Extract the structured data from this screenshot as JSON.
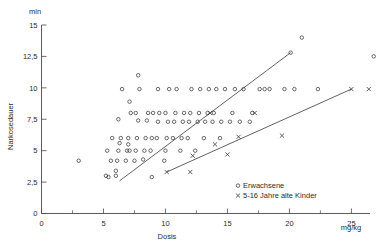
{
  "chart_data": {
    "type": "scatter",
    "title": "",
    "xlabel": "Dosis",
    "ylabel": "Narkosedauer",
    "x_unit": "mg/kg",
    "y_unit": "min",
    "xlim": [
      0,
      26.5
    ],
    "ylim": [
      0,
      15
    ],
    "grid": false,
    "legend_position": "bottom-right",
    "x_ticks": [
      0,
      5,
      10,
      15,
      20,
      25
    ],
    "x_tick_labels": [
      "0",
      "5",
      "10",
      "15",
      "20",
      "25"
    ],
    "x_minor_ticks": [
      2.5,
      7.5,
      12.5,
      17.5,
      22.5
    ],
    "y_ticks": [
      0,
      2.5,
      5,
      7.5,
      10,
      12.5,
      15
    ],
    "y_tick_labels": [
      "0",
      "2,5",
      "5",
      "7,5",
      "10",
      "12,5",
      "15"
    ],
    "series": [
      {
        "name": "Erwachsene",
        "marker": "circle",
        "points": [
          [
            3.0,
            4.2
          ],
          [
            5.2,
            3.0
          ],
          [
            5.4,
            2.9
          ],
          [
            5.3,
            5.0
          ],
          [
            5.6,
            4.2
          ],
          [
            5.7,
            6.0
          ],
          [
            6.0,
            3.4
          ],
          [
            6.0,
            3.0
          ],
          [
            6.1,
            4.2
          ],
          [
            6.2,
            5.0
          ],
          [
            6.3,
            5.6
          ],
          [
            6.4,
            6.0
          ],
          [
            6.2,
            7.5
          ],
          [
            6.5,
            9.9
          ],
          [
            6.8,
            4.2
          ],
          [
            6.9,
            5.0
          ],
          [
            7.0,
            5.5
          ],
          [
            7.0,
            6.0
          ],
          [
            7.1,
            5.0
          ],
          [
            7.2,
            8.0
          ],
          [
            7.1,
            8.9
          ],
          [
            7.5,
            4.2
          ],
          [
            7.6,
            5.0
          ],
          [
            7.7,
            6.0
          ],
          [
            7.8,
            7.4
          ],
          [
            7.6,
            8.0
          ],
          [
            7.9,
            9.9
          ],
          [
            7.8,
            11.0
          ],
          [
            8.2,
            4.3
          ],
          [
            8.3,
            5.0
          ],
          [
            8.4,
            6.0
          ],
          [
            8.5,
            7.4
          ],
          [
            8.6,
            8.0
          ],
          [
            8.8,
            5.0
          ],
          [
            8.9,
            2.9
          ],
          [
            8.9,
            6.0
          ],
          [
            9.0,
            8.0
          ],
          [
            9.3,
            6.0
          ],
          [
            9.4,
            7.3
          ],
          [
            9.5,
            8.0
          ],
          [
            9.4,
            9.9
          ],
          [
            9.9,
            4.2
          ],
          [
            10.0,
            5.0
          ],
          [
            10.1,
            6.0
          ],
          [
            10.2,
            7.3
          ],
          [
            10.0,
            8.0
          ],
          [
            10.3,
            9.9
          ],
          [
            10.6,
            6.0
          ],
          [
            10.7,
            7.3
          ],
          [
            10.8,
            8.0
          ],
          [
            10.9,
            9.9
          ],
          [
            11.2,
            5.0
          ],
          [
            11.3,
            6.0
          ],
          [
            11.4,
            7.3
          ],
          [
            11.5,
            8.0
          ],
          [
            11.8,
            6.0
          ],
          [
            11.9,
            7.3
          ],
          [
            12.0,
            8.0
          ],
          [
            12.1,
            9.9
          ],
          [
            12.4,
            5.0
          ],
          [
            12.6,
            7.3
          ],
          [
            12.7,
            8.0
          ],
          [
            12.8,
            9.9
          ],
          [
            13.1,
            6.0
          ],
          [
            13.2,
            7.3
          ],
          [
            13.4,
            8.0
          ],
          [
            13.5,
            9.9
          ],
          [
            13.8,
            7.3
          ],
          [
            13.9,
            8.0
          ],
          [
            14.1,
            9.9
          ],
          [
            14.4,
            6.0
          ],
          [
            14.5,
            7.3
          ],
          [
            14.8,
            9.9
          ],
          [
            15.2,
            7.3
          ],
          [
            15.4,
            8.0
          ],
          [
            15.6,
            9.9
          ],
          [
            16.0,
            7.3
          ],
          [
            16.3,
            9.9
          ],
          [
            16.8,
            7.3
          ],
          [
            17.0,
            8.0
          ],
          [
            17.6,
            9.9
          ],
          [
            18.0,
            9.9
          ],
          [
            18.4,
            9.9
          ],
          [
            19.6,
            9.9
          ],
          [
            20.4,
            9.9
          ],
          [
            21.0,
            14.0
          ],
          [
            20.1,
            12.8
          ],
          [
            22.3,
            9.9
          ],
          [
            26.8,
            12.5
          ]
        ]
      },
      {
        "name": "5-16 Jahre alte Kinder",
        "marker": "cross",
        "points": [
          [
            10.1,
            3.3
          ],
          [
            12.0,
            3.3
          ],
          [
            12.2,
            4.6
          ],
          [
            13.6,
            8.0
          ],
          [
            14.0,
            5.5
          ],
          [
            15.0,
            4.7
          ],
          [
            15.9,
            6.1
          ],
          [
            17.2,
            8.0
          ],
          [
            19.4,
            6.2
          ],
          [
            25.0,
            9.9
          ],
          [
            26.4,
            9.9
          ]
        ]
      }
    ],
    "fit_lines": [
      {
        "name": "adults-regression",
        "x1": 6.3,
        "y1": 2.6,
        "x2": 20.1,
        "y2": 12.8
      },
      {
        "name": "children-regression",
        "x1": 10.1,
        "y1": 3.3,
        "x2": 25.0,
        "y2": 9.9
      }
    ],
    "legend": [
      {
        "marker": "circle",
        "label": "Erwachsene"
      },
      {
        "marker": "cross",
        "label": "5-16 Jahre  alte Kinder"
      }
    ]
  }
}
